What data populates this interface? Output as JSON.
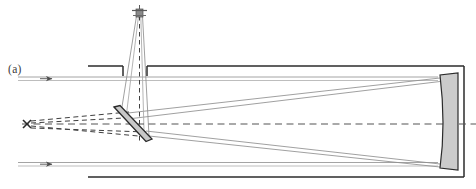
{
  "figure": {
    "panel_label": "(a)",
    "domain": "optical-ray-diagram",
    "background_color": "#ffffff"
  },
  "colors": {
    "tube_outline": "#2b2b2b",
    "ray_solid": "#9a9a9a",
    "ray_dashed": "#4a4a4a",
    "mirror_fill": "#cfcfcf",
    "mirror_stroke": "#2b2b2b",
    "axis_dashed": "#555555",
    "label_text": "#3a3a3a",
    "detector_fill": "#8a8a8a"
  },
  "components": {
    "telescope_tube": {
      "name": "telescope-tube",
      "top_y": 66,
      "bottom_y": 177,
      "left_x": 88,
      "right_x": 464,
      "aperture_gap_start_x": 123,
      "aperture_gap_end_x": 147
    },
    "primary_mirror": {
      "name": "primary-mirror",
      "x": 440,
      "y_top": 75,
      "y_bottom": 168,
      "width": 18,
      "fill": "#cfcfcf"
    },
    "fold_mirror": {
      "name": "fold-mirror",
      "x1": 115,
      "y1": 108,
      "x2": 150,
      "y2": 141,
      "thickness": 7,
      "fill": "#cfcfcf"
    },
    "detector": {
      "name": "detector",
      "x": 135,
      "y": 8,
      "width": 9,
      "height": 9
    },
    "focus_marker": {
      "name": "virtual-focus-cross",
      "x": 27,
      "y": 124,
      "size": 5
    },
    "optical_axis": {
      "name": "optical-axis",
      "y": 124,
      "x_start": 22,
      "x_end": 476,
      "style": "dashed"
    }
  },
  "rays": {
    "incoming_upper": {
      "name": "incoming-ray-upper",
      "y_a": 77,
      "y_b": 80,
      "x_start": 18,
      "arrow_x": 50
    },
    "incoming_lower": {
      "name": "incoming-ray-lower",
      "y_a": 163,
      "y_b": 166,
      "x_start": 18,
      "arrow_x": 50
    },
    "converging_upper": {
      "name": "converging-ray-upper",
      "from_x": 440,
      "from_y": 79,
      "to_x": 131,
      "to_y": 118
    },
    "converging_lower": {
      "name": "converging-ray-lower",
      "from_x": 440,
      "from_y": 165,
      "to_x": 140,
      "to_y": 131
    },
    "folded_cone_left": {
      "name": "folded-cone-left-edge",
      "from_x": 123,
      "from_y": 118,
      "to_x": 137,
      "to_y": 16
    },
    "folded_cone_right": {
      "name": "folded-cone-right-edge",
      "from_x": 146,
      "from_y": 131,
      "to_x": 142,
      "to_y": 16
    },
    "virtual_dashed_upper": {
      "name": "virtual-ray-upper",
      "from_x": 27,
      "from_y": 122,
      "to_x": 128,
      "to_y": 113
    },
    "virtual_dashed_lower": {
      "name": "virtual-ray-lower",
      "from_x": 27,
      "from_y": 126,
      "to_x": 150,
      "to_y": 141
    }
  }
}
